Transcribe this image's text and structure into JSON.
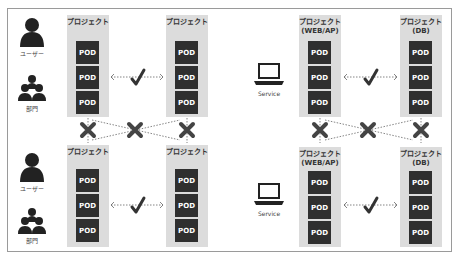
{
  "diagram": {
    "top_left": {
      "users": [
        {
          "label": "ユーザー",
          "icon": "user-icon"
        },
        {
          "label": "部門",
          "icon": "group-icon"
        }
      ],
      "projects": [
        {
          "title": "プロジェクト",
          "pods": [
            "POD",
            "POD",
            "POD"
          ]
        },
        {
          "title": "プロジェクト",
          "pods": [
            "POD",
            "POD",
            "POD"
          ]
        }
      ],
      "link": "allowed"
    },
    "bottom_left": {
      "users": [
        {
          "label": "ユーザー",
          "icon": "user-icon"
        },
        {
          "label": "部門",
          "icon": "group-icon"
        }
      ],
      "projects": [
        {
          "title": "プロジェクト",
          "pods": [
            "POD",
            "POD",
            "POD"
          ]
        },
        {
          "title": "プロジェクト",
          "pods": [
            "POD",
            "POD",
            "POD"
          ]
        }
      ],
      "link": "allowed"
    },
    "top_right": {
      "service": {
        "label": "Service",
        "icon": "laptop-icon"
      },
      "projects": [
        {
          "title": "プロジェクト\n(WEB/AP)",
          "line1": "プロジェクト",
          "line2": "(WEB/AP)",
          "pods": [
            "POD",
            "POD",
            "POD"
          ]
        },
        {
          "title": "プロジェクト\n(DB)",
          "line1": "プロジェクト",
          "line2": "(DB)",
          "pods": [
            "POD",
            "POD",
            "POD"
          ]
        }
      ],
      "link": "allowed"
    },
    "bottom_right": {
      "service": {
        "label": "Service",
        "icon": "laptop-icon"
      },
      "projects": [
        {
          "line1": "プロジェクト",
          "line2": "(WEB/AP)",
          "pods": [
            "POD",
            "POD",
            "POD"
          ]
        },
        {
          "line1": "プロジェクト",
          "line2": "(DB)",
          "pods": [
            "POD",
            "POD",
            "POD"
          ]
        }
      ],
      "link": "allowed"
    },
    "cross_links": "denied",
    "colors": {
      "pod": "#2f2f2f",
      "project_bg": "#dcdcdc",
      "link": "#555555",
      "mark": "#333333"
    }
  }
}
